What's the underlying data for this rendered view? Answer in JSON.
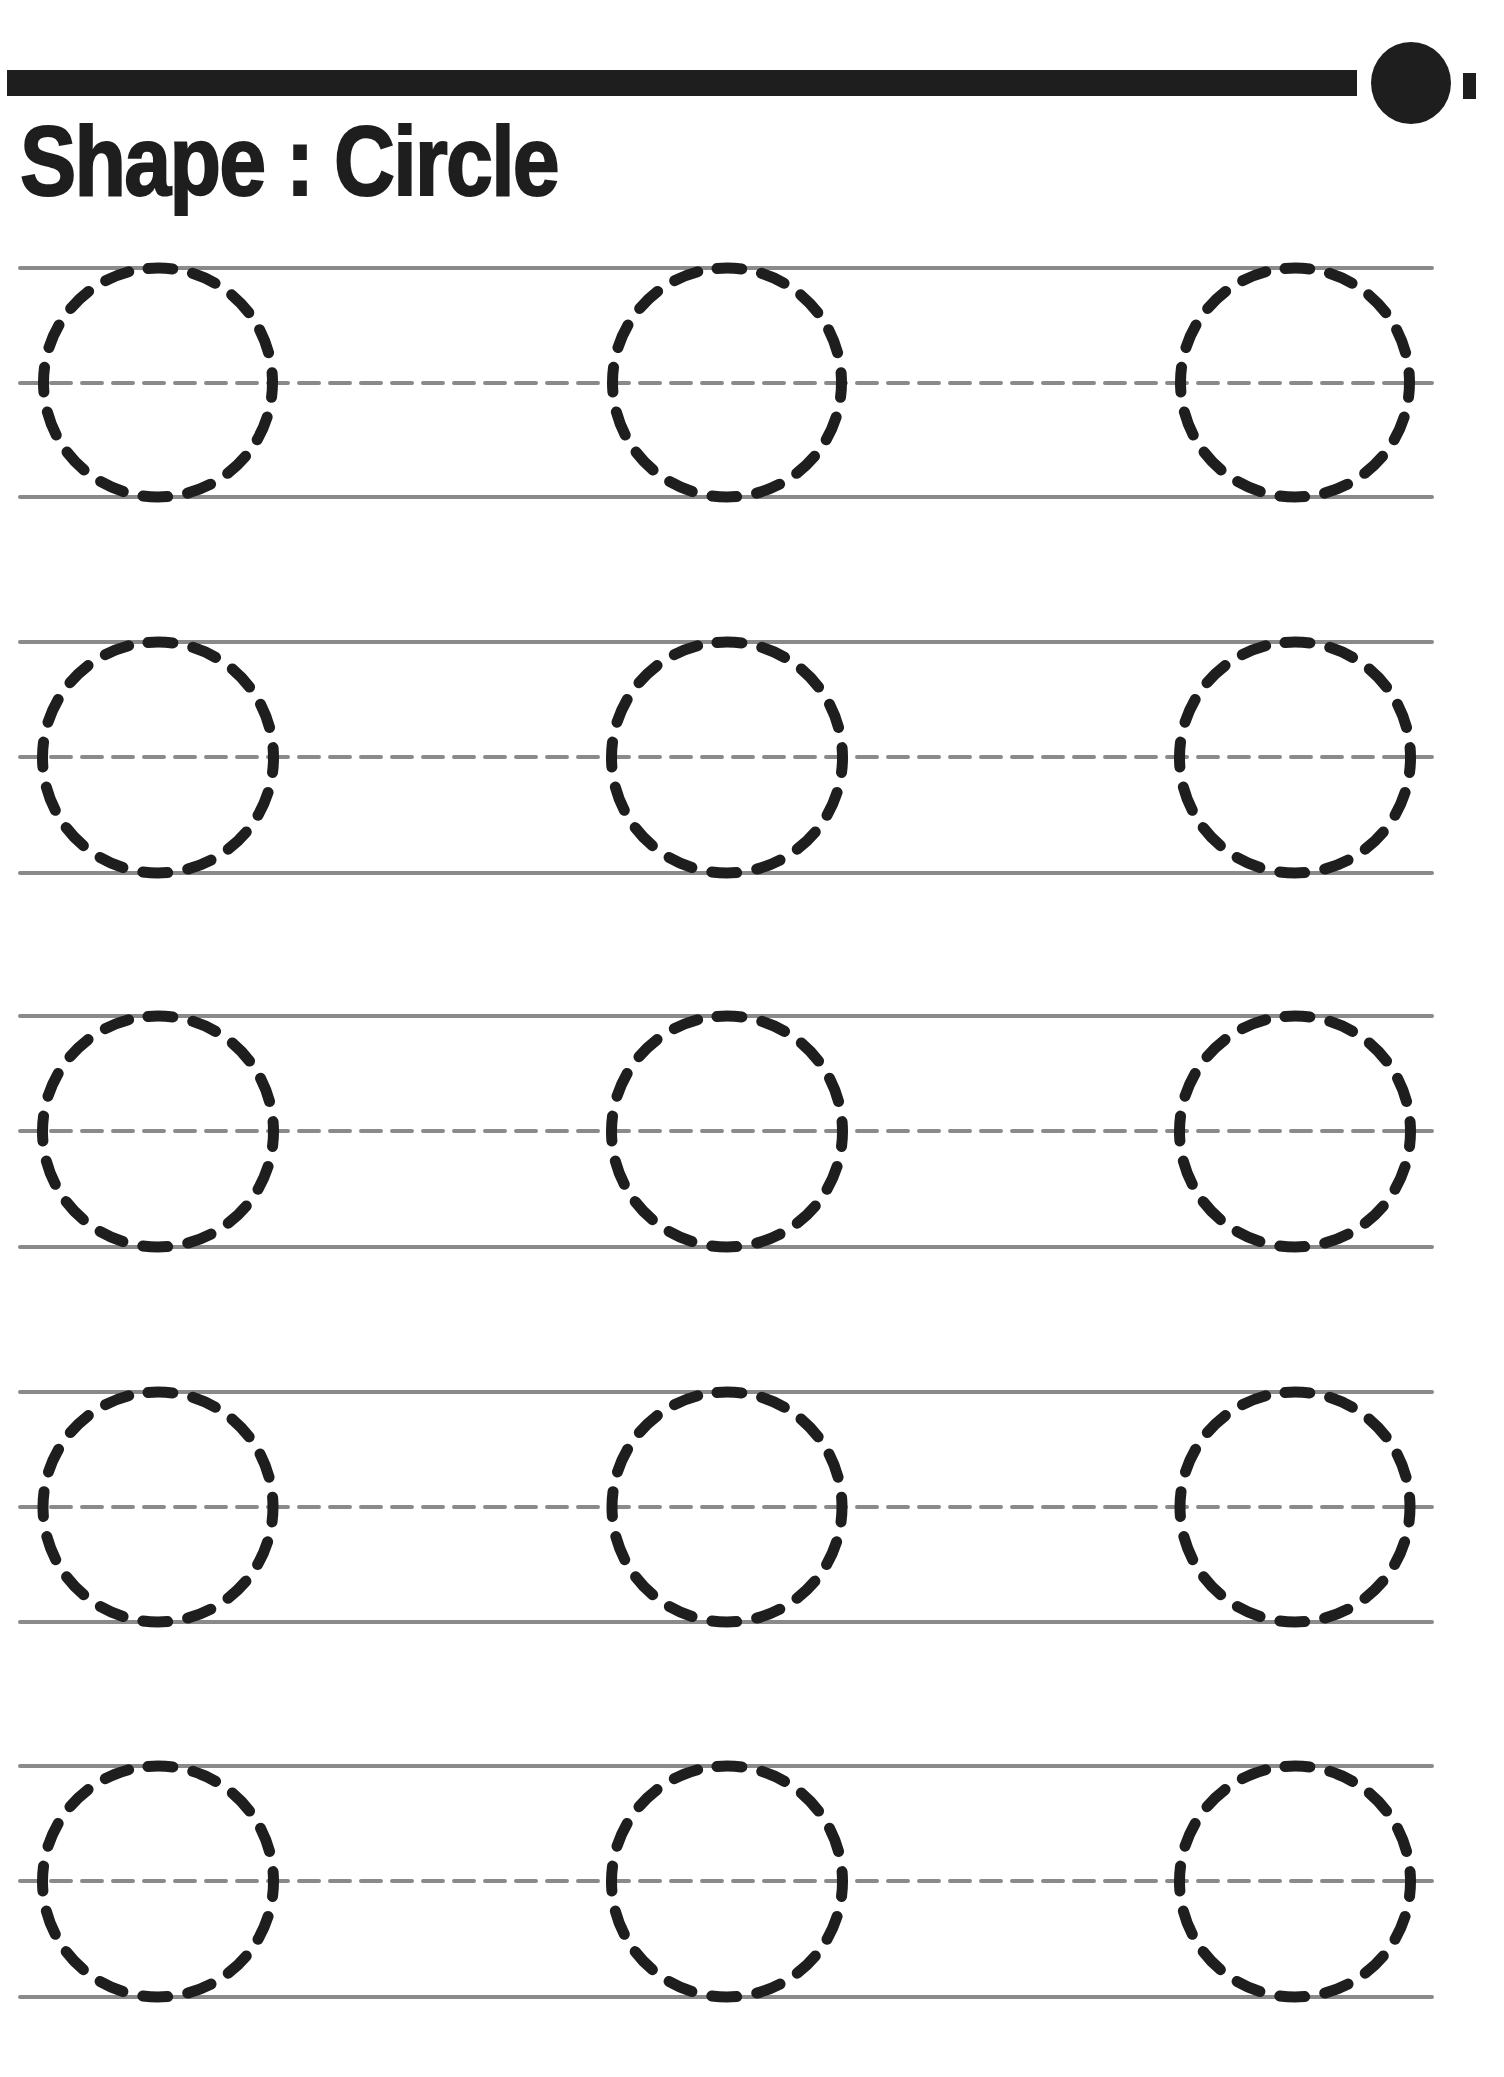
{
  "worksheet": {
    "title": "Shape : Circle",
    "shape": "circle",
    "rows": 5,
    "columns": 3,
    "colors": {
      "ink": "#1e1e1e",
      "guide_line": "#8a8a8a"
    },
    "layout": {
      "row_top_lines_y": [
        268,
        642,
        1016,
        1392,
        1766
      ],
      "row_mid_lines_y": [
        383,
        757,
        1131,
        1507,
        1881
      ],
      "row_bottom_lines_y": [
        497,
        873,
        1247,
        1622,
        1997
      ],
      "column_centers_x": [
        158,
        727,
        1295
      ],
      "circle_radius": 113
    }
  }
}
